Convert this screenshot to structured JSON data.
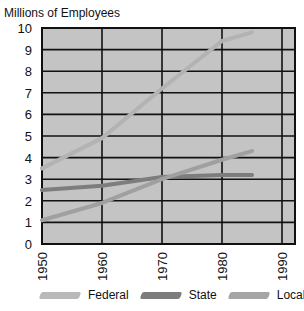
{
  "chart_data": {
    "type": "line",
    "title": "",
    "ylabel": "Millions of Employees",
    "xlabel": "",
    "x": [
      1950,
      1960,
      1970,
      1980,
      1985
    ],
    "xticks": [
      "1950",
      "1960",
      "1970",
      "1980",
      "1990"
    ],
    "yticks": [
      "0",
      "1",
      "2",
      "3",
      "4",
      "5",
      "6",
      "7",
      "8",
      "9",
      "10"
    ],
    "xlim": [
      1950,
      1992
    ],
    "ylim": [
      0,
      10
    ],
    "grid": true,
    "legend_position": "bottom",
    "series": [
      {
        "name": "Federal",
        "color": "#b3b3b3",
        "values": [
          3.5,
          4.9,
          7.2,
          9.4,
          9.8
        ]
      },
      {
        "name": "State",
        "color": "#7d7d7d",
        "values": [
          2.5,
          2.7,
          3.1,
          3.2,
          3.2
        ]
      },
      {
        "name": "Local",
        "color": "#a0a0a0",
        "values": [
          1.1,
          1.9,
          3.0,
          3.9,
          4.3
        ]
      }
    ]
  },
  "legend": {
    "federal": "Federal",
    "state": "State",
    "local": "Local"
  },
  "axis": {
    "y_title": "Millions of Employees"
  }
}
